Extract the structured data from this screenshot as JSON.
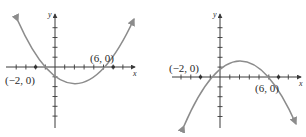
{
  "figure": {
    "panels": [
      {
        "id": "left",
        "description": "Upward-opening parabola with x-intercepts (-2,0) and (6,0)",
        "x_axis_label": "x",
        "y_axis_label": "y",
        "points": [
          {
            "label": "(−2, 0)",
            "x": -2,
            "y": 0
          },
          {
            "label": "(6, 0)",
            "x": 6,
            "y": 0
          }
        ],
        "y_intercept": -3,
        "vertex": {
          "x": 2,
          "y": -4
        },
        "opens": "up"
      },
      {
        "id": "right",
        "description": "Downward-opening parabola with x-intercepts (-2,0) and (6,0)",
        "x_axis_label": "x",
        "y_axis_label": "y",
        "points": [
          {
            "label": "(−2, 0)",
            "x": -2,
            "y": 0
          },
          {
            "label": "(6, 0)",
            "x": 6,
            "y": 0
          }
        ],
        "y_intercept": 3,
        "vertex": {
          "x": 2,
          "y": 4
        },
        "opens": "down"
      }
    ],
    "colors": {
      "axis": "#3a3a3a",
      "curve": "#8c8c8c",
      "text": "#2a2a2a",
      "background": "#ffffff"
    }
  }
}
